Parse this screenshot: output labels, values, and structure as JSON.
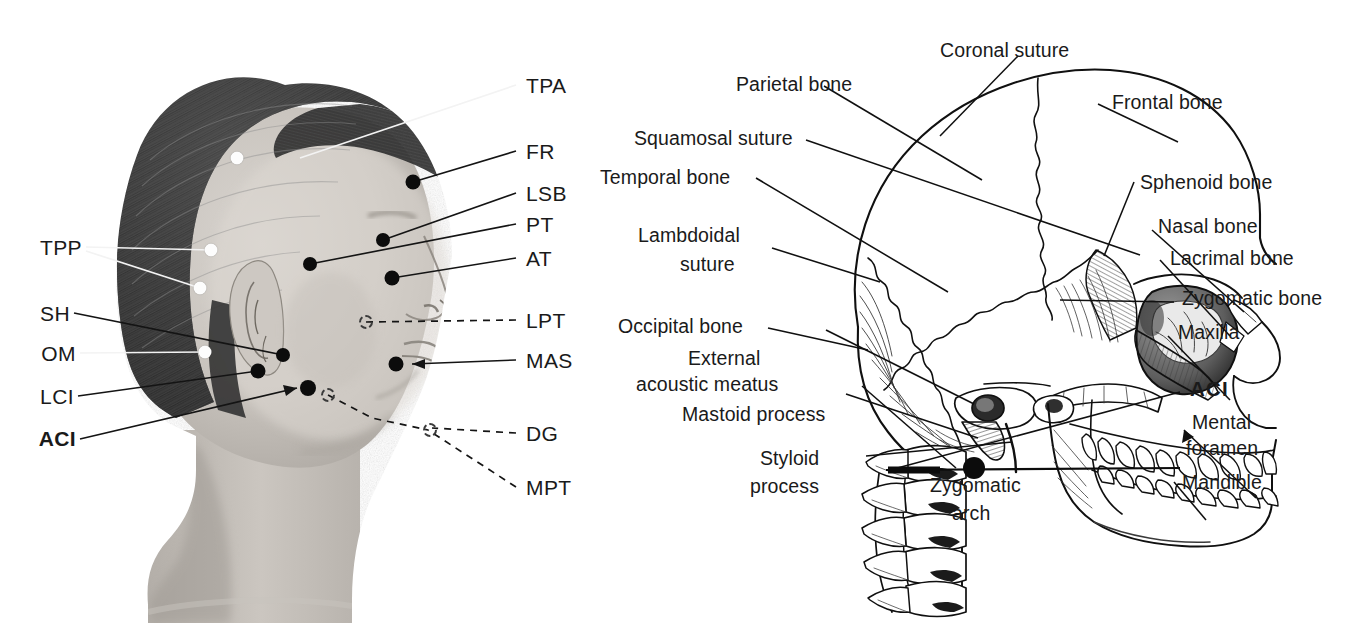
{
  "figure": {
    "panels": [
      "photograph-lateral-head",
      "illustration-lateral-skull"
    ]
  },
  "colors": {
    "ink": "#1a1a1a",
    "line": "#111111",
    "dot_filled": "#0c0c0c",
    "dot_white": "#fdfdfd",
    "dot_open_border": "#3a3a3a",
    "background": "#ffffff"
  },
  "photo_panel": {
    "left_labels": [
      {
        "text": "TPP",
        "bold": false
      },
      {
        "text": "SH",
        "bold": false
      },
      {
        "text": "OM",
        "bold": false
      },
      {
        "text": "LCI",
        "bold": false
      },
      {
        "text": "ACI",
        "bold": true
      }
    ],
    "right_labels": [
      {
        "text": "TPA",
        "bold": false,
        "dashed": false
      },
      {
        "text": "FR",
        "bold": false,
        "dashed": false
      },
      {
        "text": "LSB",
        "bold": false,
        "dashed": false
      },
      {
        "text": "PT",
        "bold": false,
        "dashed": false
      },
      {
        "text": "AT",
        "bold": false,
        "dashed": false
      },
      {
        "text": "LPT",
        "bold": false,
        "dashed": true
      },
      {
        "text": "MAS",
        "bold": false,
        "dashed": false
      },
      {
        "text": "DG",
        "bold": false,
        "dashed": true
      },
      {
        "text": "MPT",
        "bold": false,
        "dashed": true
      }
    ],
    "markers": [
      {
        "code": "TPA",
        "style": "white"
      },
      {
        "code": "TPP-upper",
        "style": "white"
      },
      {
        "code": "TPP-lower",
        "style": "white"
      },
      {
        "code": "OM",
        "style": "white"
      },
      {
        "code": "FR",
        "style": "filled"
      },
      {
        "code": "PT",
        "style": "filled"
      },
      {
        "code": "AT",
        "style": "filled"
      },
      {
        "code": "SH",
        "style": "filled"
      },
      {
        "code": "LCI",
        "style": "filled"
      },
      {
        "code": "ACI",
        "style": "filled"
      },
      {
        "code": "MAS",
        "style": "filled"
      },
      {
        "code": "LPT",
        "style": "open"
      },
      {
        "code": "DG-posterior",
        "style": "open"
      },
      {
        "code": "DG-anterior",
        "style": "open"
      }
    ]
  },
  "skull_panel": {
    "left_labels": [
      {
        "text": "Parietal bone"
      },
      {
        "text": "Squamosal suture"
      },
      {
        "text": "Temporal bone"
      },
      {
        "text": "Lambdoidal",
        "text2": "suture"
      },
      {
        "text": "Occipital bone"
      },
      {
        "text": "External",
        "text2": "acoustic meatus"
      },
      {
        "text": "Mastoid process"
      },
      {
        "text": "Styloid",
        "text2": "process"
      }
    ],
    "top_label": {
      "text": "Coronal suture"
    },
    "bottom_label": {
      "text": "Zygomatic",
      "text2": "arch"
    },
    "right_labels": [
      {
        "text": "Frontal bone",
        "bold": false
      },
      {
        "text": "Sphenoid bone",
        "bold": false
      },
      {
        "text": "Nasal bone",
        "bold": false
      },
      {
        "text": "Lacrimal bone",
        "bold": false
      },
      {
        "text": "Zygomatic bone",
        "bold": false
      },
      {
        "text": "Maxilla",
        "bold": false
      },
      {
        "text": "ACI",
        "bold": true
      },
      {
        "text": "Mental",
        "text2": "foramen",
        "bold": false
      },
      {
        "text": "Mandible",
        "bold": false
      }
    ],
    "markers": [
      {
        "code": "ACI",
        "style": "filled"
      }
    ]
  }
}
